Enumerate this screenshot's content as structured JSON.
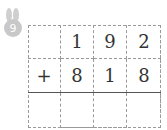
{
  "badge": {
    "label": "9",
    "color": "#c8c8c8"
  },
  "problem": {
    "rows": [
      [
        "",
        "1",
        "9",
        "2"
      ],
      [
        "+",
        "8",
        "1",
        "8"
      ],
      [
        "",
        "",
        "",
        ""
      ]
    ]
  }
}
